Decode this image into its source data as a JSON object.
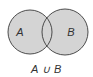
{
  "diagram": {
    "type": "venn",
    "operation": "union",
    "caption": "A ∪ B",
    "sets": [
      {
        "label": "A",
        "cx": 30,
        "cy": 32,
        "r": 22,
        "shaded": true
      },
      {
        "label": "B",
        "cx": 65,
        "cy": 32,
        "r": 23,
        "shaded": true
      }
    ],
    "colors": {
      "fill": "#d4d4d4",
      "stroke": "#3a3a3a",
      "text": "#333333",
      "background": "#ffffff"
    }
  }
}
